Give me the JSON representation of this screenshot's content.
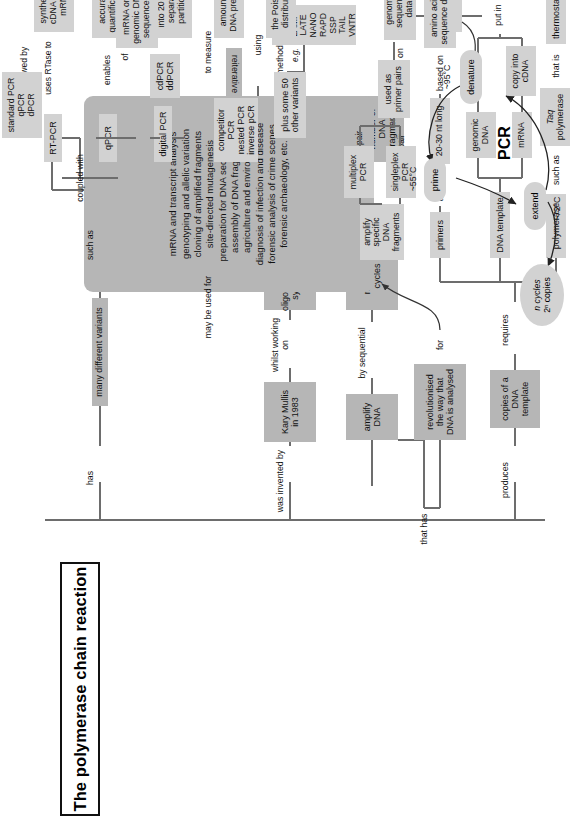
{
  "diagram": {
    "title": "The polymerase chain reaction",
    "type": "concept-map",
    "orientation": "rotated-90-ccw",
    "colors": {
      "spine_box": "#b6b6b6",
      "branch_box": "#d2d2d2",
      "line": "#6d6d6d",
      "text": "#111111",
      "background": "#ffffff"
    }
  },
  "spine_connectors": {
    "was_invented_by": "was invented by",
    "has": "has",
    "produces": "produces"
  },
  "inventor_branch": {
    "kary_mullis": "Kary Mullis\nin 1983",
    "whilst_working_on": "whilst working on",
    "oligonucleotide_synthesis": "oligonucleotide\nsynthesis",
    "made_by": "made\nby",
    "thinking_about": "thinking about",
    "reiterative_loops": "reiterative loops in computer programs",
    "dna_templates": "DNA templates\npolymerases\nprimers",
    "devised_method_to": "devised method to",
    "amplify_dna": "amplify DNA",
    "by_sequential": "by sequential",
    "repetitive_cycles": "repetitive cycles",
    "that_generate": "that generate",
    "exponential_increase": "an exponential\nincrease in the\nnumber of DNA\nfragments",
    "that_has": "that has",
    "revolutionised": "revolutionised\nthe way that\nDNA is analysed",
    "for": "for"
  },
  "variants_branch": {
    "many_different_variants": "many different variants",
    "such_as": "such as",
    "rt_pcr": "RT-PCR",
    "qpcr": "qPCR",
    "digital_pcr": "digital PCR",
    "competitor_pcr": "competitor PCR\nnested PCR\ninverse pCR",
    "plus_some_50": "plus some 50\nother variants",
    "eg": "e.g.",
    "other_variant_list": "AFLP\nIPCR\nLAMP\nLATE\nNANO\nRAPD\nSSP\nTAIL\nVNTR",
    "coupled_with": "coupled with",
    "uses_rtase_to": "uses RTase to",
    "synthesise_cdna": "synthesise\ncDNA from\nmRNA",
    "followed_by": "followed by",
    "standard_pcr_list": "standard PCR\nqPCR\ndPCR",
    "enables": "enables",
    "accurate_quantification": "accurate\nquantification",
    "of": "of",
    "mrna_genomic": "mRNA or\ngenomic DNA\nsequences",
    "cdpcr_ddpcr": "cdPCR\nddPCR",
    "splits_reaction": "splits reaction\ninto 20 000\nseparate\npartitions",
    "to_measure": "to measure",
    "amount_of_dna": "amount of\nDNA present",
    "using": "using",
    "poisson": "the Poisson\ndistribution",
    "may_be_used_for": "may be used for",
    "applications": "mRNA and transcript analysis\ngenotyping and allelic variation\ncloning of amplified fragments\nsite-directed mutagenesis\npreparation for DNA sequencing\nassembly of DNA fragments\nagriculture and environment\ndiagnosis of infection and disease\nforensic analysis of crime scenes\nforensic archaeology, etc."
  },
  "produces_branch": {
    "copies_of_template": "copies of a\nDNA template",
    "requires": "requires",
    "polymerase": "polymerase",
    "such_as": "such as",
    "taq_polymerase_italic": "Taq",
    "taq_polymerase_rest": "polymerase",
    "that_is": "that is",
    "thermostable": "thermostable",
    "dna_template": "DNA template",
    "genomic_dna": "genomic\nDNA",
    "mrna": "mRNA",
    "copy_into_cdna": "copy into\ncDNA",
    "put_in": "put in",
    "thermal_cycler": "thermal cycler",
    "primers": "primers",
    "usually": "usually",
    "twenty_thirty_nt": "20-30 nt long",
    "based_on": "based on",
    "amino_acid_seq": "amino acid\nsequence data",
    "or_often_on": "or often on",
    "genome_seq": "genome\nsequence data",
    "used_as": "used as",
    "used_as_primer_pairs": "used as\nprimer pairs",
    "one_pair": "1 pair",
    "more_than_one_pair": ">1 pair",
    "singleplex_pcr": "singleplex\nPCR",
    "multiplex_pcr": "multiplex\nPCR",
    "amplify_specific": "amplify specific\nDNA fragments"
  },
  "pcr_cycle": {
    "center_label": "PCR",
    "denature": "denature",
    "denature_temp": "~95°C",
    "prime": "prime",
    "prime_temp": "~55°C",
    "extend": "extend",
    "extend_temp": "~72°C",
    "result_line1": "n cycles",
    "result_line2": "2ⁿ copies"
  }
}
